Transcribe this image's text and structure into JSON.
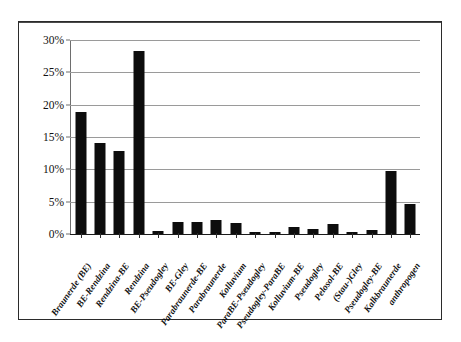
{
  "chart_data": {
    "type": "bar",
    "title": "",
    "subtitle": "",
    "xlabel": "",
    "ylabel": "",
    "ylim": [
      0,
      30
    ],
    "ytick_labels": [
      "0%",
      "5%",
      "10%",
      "15%",
      "20%",
      "25%",
      "30%"
    ],
    "ytick_values": [
      0,
      5,
      10,
      15,
      20,
      25,
      30
    ],
    "grid": "horizontal",
    "legend": "none",
    "bar_color": "#0d0d0d",
    "categories": [
      "Braunerde (BE)",
      "BE-Rendzina",
      "Rendzina-BE",
      "Rendzina",
      "BE-Pseudogley",
      "BE-Gley",
      "Parabraunerde-BE",
      "Parabraunerde",
      "Kolluvium",
      "ParaBE-Pseudogley",
      "Pseudogley-ParaBE",
      "Kolluvium-BE",
      "Pseudogley",
      "Pelosol-BE",
      "(Stau-)Gley",
      "Pseudogley-BE",
      "Kalkbraunerde",
      "anthropogen"
    ],
    "values": [
      18.9,
      14.0,
      12.9,
      28.3,
      0.5,
      1.8,
      1.8,
      2.2,
      1.7,
      0.3,
      0.3,
      1.1,
      0.8,
      1.5,
      0.3,
      0.6,
      9.7,
      4.7
    ],
    "value_labels": [
      "18.9%",
      "14.0%",
      "12.9%",
      "28.3%",
      "0.5%",
      "1.8%",
      "1.8%",
      "2.2%",
      "1.7%",
      "0.3%",
      "0.3%",
      "1.1%",
      "0.8%",
      "1.5%",
      "0.3%",
      "0.6%",
      "9.7%",
      "4.7%"
    ]
  }
}
